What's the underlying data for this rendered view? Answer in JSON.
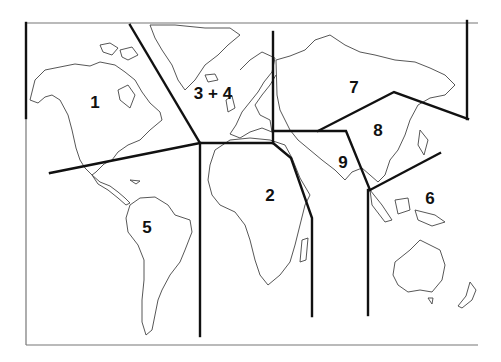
{
  "map": {
    "type": "world-outline",
    "zones": [
      {
        "id": "zone-1",
        "label": "1",
        "region": "North America",
        "x": 95,
        "y": 103
      },
      {
        "id": "zone-2",
        "label": "2",
        "region": "Africa",
        "x": 270,
        "y": 196
      },
      {
        "id": "zone-3-4",
        "label": "3 + 4",
        "region": "Greenland / Europe",
        "x": 213,
        "y": 94
      },
      {
        "id": "zone-5",
        "label": "5",
        "region": "South America",
        "x": 147,
        "y": 228
      },
      {
        "id": "zone-6",
        "label": "6",
        "region": "Oceania / Southeast Asia",
        "x": 430,
        "y": 199
      },
      {
        "id": "zone-7",
        "label": "7",
        "region": "Russia / North Asia",
        "x": 354,
        "y": 88
      },
      {
        "id": "zone-8",
        "label": "8",
        "region": "East Asia",
        "x": 378,
        "y": 131
      },
      {
        "id": "zone-9",
        "label": "9",
        "region": "Middle East / South Asia",
        "x": 343,
        "y": 163
      }
    ],
    "colors": {
      "boundary": "#111111",
      "coast": "#444444",
      "frame": "#777777",
      "background": "#ffffff"
    }
  }
}
